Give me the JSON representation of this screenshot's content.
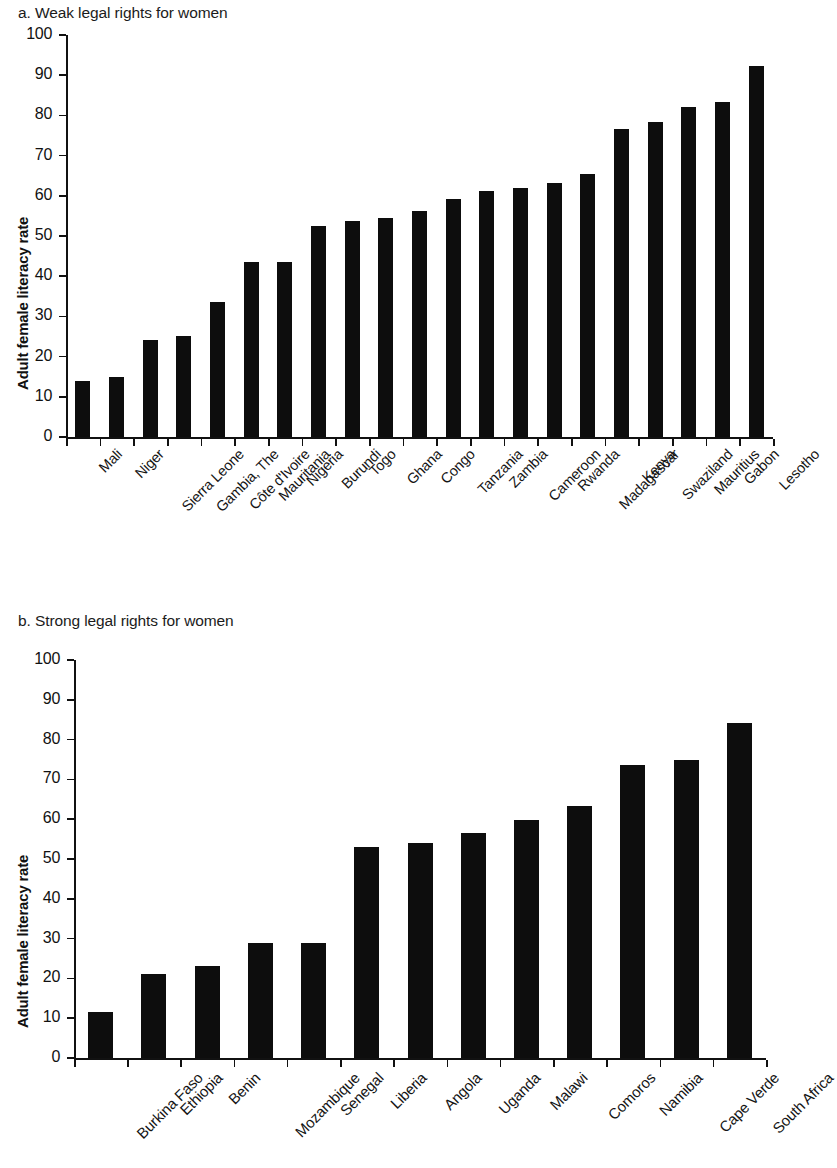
{
  "figure": {
    "ylabel": "Adult female literacy rate"
  },
  "panels": [
    {
      "id": "a",
      "title": "a. Weak legal rights for women",
      "ylabel": "Adult female literacy rate"
    },
    {
      "id": "b",
      "title": "b. Strong legal rights for women",
      "ylabel": "Adult female literacy rate"
    }
  ],
  "yticks": [
    "0",
    "10",
    "20",
    "30",
    "40",
    "50",
    "60",
    "70",
    "80",
    "90",
    "100"
  ],
  "chart_data": [
    {
      "type": "bar",
      "title": "a. Weak legal rights for women",
      "xlabel": "",
      "ylabel": "Adult female literacy rate",
      "ylim": [
        0,
        100
      ],
      "ytick_step": 10,
      "grid": false,
      "legend": "none",
      "bar_color": "#0d0d0d",
      "categories": [
        "Mali",
        "Niger",
        "Sierra Leone",
        "Gambia, The",
        "Côte d'Ivoire",
        "Mauritania",
        "Nigeria",
        "Burundi",
        "Togo",
        "Ghana",
        "Congo",
        "Tanzania",
        "Zambia",
        "Cameroon",
        "Rwanda",
        "Madagascar",
        "Kenya",
        "Swaziland",
        "Mauritius",
        "Gabon",
        "Lesotho"
      ],
      "values": [
        13.9,
        15.0,
        24.1,
        25.1,
        33.5,
        43.5,
        43.5,
        52.5,
        53.8,
        54.6,
        56.2,
        59.1,
        61.2,
        61.9,
        63.1,
        65.4,
        76.6,
        78.4,
        82.2,
        83.3,
        92.2
      ]
    },
    {
      "type": "bar",
      "title": "b. Strong legal rights for women",
      "xlabel": "",
      "ylabel": "Adult female literacy rate",
      "ylim": [
        0,
        100
      ],
      "ytick_step": 10,
      "grid": false,
      "legend": "none",
      "bar_color": "#0d0d0d",
      "categories": [
        "Burkina Faso",
        "Ethiopia",
        "Benin",
        "Mozambique",
        "Senegal",
        "Liberia",
        "Angola",
        "Uganda",
        "Malawi",
        "Comoros",
        "Namibia",
        "Cape Verde",
        "South Africa"
      ],
      "values": [
        11.5,
        21.0,
        23.0,
        28.9,
        29.0,
        52.9,
        54.0,
        56.5,
        59.7,
        63.4,
        73.7,
        74.8,
        84.2
      ]
    }
  ]
}
